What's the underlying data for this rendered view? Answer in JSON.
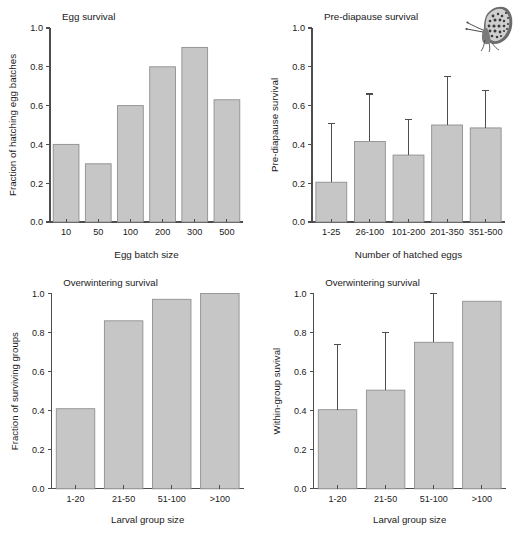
{
  "figure": {
    "background_color": "#ffffff",
    "bar_fill_color": "#c6c6c6",
    "bar_stroke_color": "#8f8f8f",
    "axis_color": "#4d4d4d",
    "text_color": "#1a1a1a"
  },
  "decoration": {
    "butterfly_icon": "butterfly-icon",
    "butterfly_caption": "checkerspot butterfly illustration"
  },
  "chart_data": [
    {
      "id": "egg-survival",
      "type": "bar",
      "title": "Egg survival",
      "xlabel": "Egg batch size",
      "ylabel": "Fraction of hatching egg batches",
      "categories": [
        "10",
        "50",
        "100",
        "200",
        "300",
        "500"
      ],
      "values": [
        0.4,
        0.3,
        0.6,
        0.8,
        0.9,
        0.63
      ],
      "errors_upper": [
        null,
        null,
        null,
        null,
        null,
        null
      ],
      "ylim": [
        0.0,
        1.0
      ],
      "yticks": [
        0.0,
        0.2,
        0.4,
        0.6,
        0.8,
        1.0
      ],
      "yticklabels": [
        "0.0",
        "0.2",
        "0.4",
        "0.6",
        "0.8",
        "1.0"
      ],
      "grid": false,
      "legend": false
    },
    {
      "id": "pre-diapause-survival",
      "type": "bar",
      "title": "Pre-diapause survival",
      "xlabel": "Number of hatched eggs",
      "ylabel": "Pre-diapause survival",
      "categories": [
        "1-25",
        "26-100",
        "101-200",
        "201-350",
        "351-500"
      ],
      "values": [
        0.205,
        0.415,
        0.345,
        0.5,
        0.485
      ],
      "errors_upper": [
        0.51,
        0.66,
        0.53,
        0.75,
        0.68
      ],
      "ylim": [
        0.0,
        1.0
      ],
      "yticks": [
        0.0,
        0.2,
        0.4,
        0.6,
        0.8,
        1.0
      ],
      "yticklabels": [
        "0.0",
        "0.2",
        "0.4",
        "0.6",
        "0.8",
        "1.0"
      ],
      "grid": false,
      "legend": false
    },
    {
      "id": "overwintering-survival-groups",
      "type": "bar",
      "title": "Overwintering survival",
      "xlabel": "Larval group size",
      "ylabel": "Fraction of surviving groups",
      "categories": [
        "1-20",
        "21-50",
        "51-100",
        ">100"
      ],
      "values": [
        0.41,
        0.86,
        0.97,
        1.0
      ],
      "errors_upper": [
        null,
        null,
        null,
        null
      ],
      "ylim": [
        0.0,
        1.0
      ],
      "yticks": [
        0.0,
        0.2,
        0.4,
        0.6,
        0.8,
        1.0
      ],
      "yticklabels": [
        "0.0",
        "0.2",
        "0.4",
        "0.6",
        "0.8",
        "1.0"
      ],
      "grid": false,
      "legend": false
    },
    {
      "id": "overwintering-survival-within-group",
      "type": "bar",
      "title": "Overwintering survival",
      "xlabel": "Larval group size",
      "ylabel": "Within-group suvival",
      "categories": [
        "1-20",
        "21-50",
        "51-100",
        ">100"
      ],
      "values": [
        0.405,
        0.505,
        0.75,
        0.96
      ],
      "errors_upper": [
        0.74,
        0.8,
        1.0,
        null
      ],
      "ylim": [
        0.0,
        1.0
      ],
      "yticks": [
        0.0,
        0.2,
        0.4,
        0.6,
        0.8,
        1.0
      ],
      "yticklabels": [
        "0.0",
        "0.2",
        "0.4",
        "0.6",
        "0.8",
        "1.0"
      ],
      "grid": false,
      "legend": false
    }
  ]
}
